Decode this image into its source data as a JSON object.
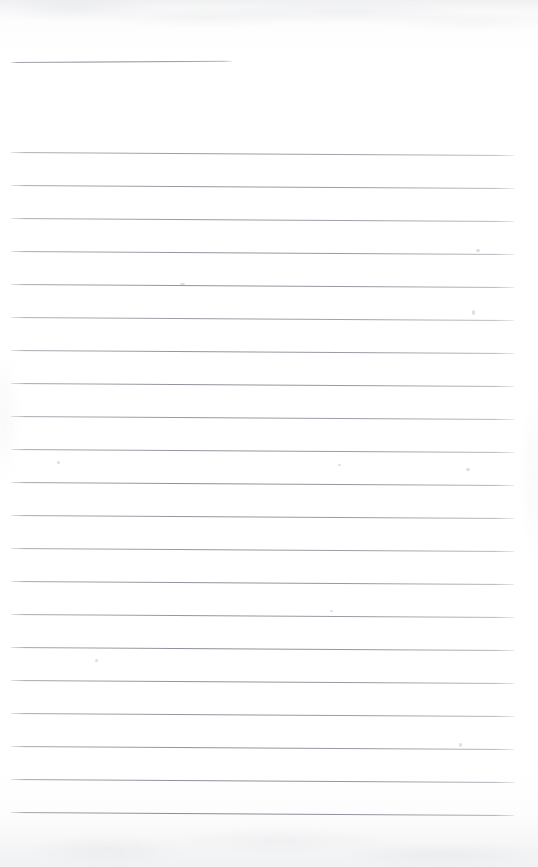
{
  "document": {
    "kind": "scanned-blank-ruled-page",
    "title": "Blank Ruled Notebook Page",
    "page_width": 538,
    "page_height": 867,
    "has_text": false,
    "has_handwriting": false,
    "visible_text": "",
    "paper_color": "#fefefe",
    "rule_color": "#7c7e88",
    "edge_shadow_color": "#eff0f1",
    "orientation": "portrait"
  },
  "rules": {
    "count": 22,
    "left_margin_px": 11,
    "right_end_px": 514,
    "line_spacing_px": 33,
    "line_thickness_px": 1,
    "first_line_y_px": 62,
    "last_line_y_px": 812,
    "lines": [
      {
        "index": 1,
        "y": 62,
        "x1": 11,
        "x2": 232,
        "partial": true,
        "skew_deg": -0.32,
        "opacity": 0.92
      },
      {
        "index": 2,
        "y": 152,
        "x1": 11,
        "x2": 514,
        "partial": false,
        "skew_deg": 0.34,
        "opacity": 0.8
      },
      {
        "index": 3,
        "y": 185,
        "x1": 11,
        "x2": 514,
        "partial": false,
        "skew_deg": 0.34,
        "opacity": 0.84
      },
      {
        "index": 4,
        "y": 218,
        "x1": 11,
        "x2": 514,
        "partial": false,
        "skew_deg": 0.34,
        "opacity": 0.82
      },
      {
        "index": 5,
        "y": 251,
        "x1": 11,
        "x2": 514,
        "partial": false,
        "skew_deg": 0.34,
        "opacity": 0.86
      },
      {
        "index": 6,
        "y": 284,
        "x1": 11,
        "x2": 514,
        "partial": false,
        "skew_deg": 0.34,
        "opacity": 0.88
      },
      {
        "index": 7,
        "y": 317,
        "x1": 11,
        "x2": 514,
        "partial": false,
        "skew_deg": 0.34,
        "opacity": 0.8
      },
      {
        "index": 8,
        "y": 350,
        "x1": 11,
        "x2": 514,
        "partial": false,
        "skew_deg": 0.34,
        "opacity": 0.86
      },
      {
        "index": 9,
        "y": 383,
        "x1": 11,
        "x2": 514,
        "partial": false,
        "skew_deg": 0.34,
        "opacity": 0.88
      },
      {
        "index": 10,
        "y": 416,
        "x1": 11,
        "x2": 514,
        "partial": false,
        "skew_deg": 0.34,
        "opacity": 0.84
      },
      {
        "index": 11,
        "y": 449,
        "x1": 11,
        "x2": 514,
        "partial": false,
        "skew_deg": 0.34,
        "opacity": 0.86
      },
      {
        "index": 12,
        "y": 482,
        "x1": 11,
        "x2": 514,
        "partial": false,
        "skew_deg": 0.34,
        "opacity": 0.9
      },
      {
        "index": 13,
        "y": 515,
        "x1": 11,
        "x2": 514,
        "partial": false,
        "skew_deg": 0.34,
        "opacity": 0.86
      },
      {
        "index": 14,
        "y": 548,
        "x1": 11,
        "x2": 514,
        "partial": false,
        "skew_deg": 0.34,
        "opacity": 0.84
      },
      {
        "index": 15,
        "y": 581,
        "x1": 11,
        "x2": 514,
        "partial": false,
        "skew_deg": 0.34,
        "opacity": 0.88
      },
      {
        "index": 16,
        "y": 614,
        "x1": 11,
        "x2": 514,
        "partial": false,
        "skew_deg": 0.34,
        "opacity": 0.86
      },
      {
        "index": 17,
        "y": 647,
        "x1": 11,
        "x2": 514,
        "partial": false,
        "skew_deg": 0.34,
        "opacity": 0.9
      },
      {
        "index": 18,
        "y": 680,
        "x1": 11,
        "x2": 514,
        "partial": false,
        "skew_deg": 0.34,
        "opacity": 0.88
      },
      {
        "index": 19,
        "y": 713,
        "x1": 11,
        "x2": 514,
        "partial": false,
        "skew_deg": 0.34,
        "opacity": 0.86
      },
      {
        "index": 20,
        "y": 746,
        "x1": 11,
        "x2": 514,
        "partial": false,
        "skew_deg": 0.34,
        "opacity": 0.88
      },
      {
        "index": 21,
        "y": 779,
        "x1": 11,
        "x2": 514,
        "partial": false,
        "skew_deg": 0.34,
        "opacity": 0.9
      },
      {
        "index": 22,
        "y": 812,
        "x1": 11,
        "x2": 514,
        "partial": false,
        "skew_deg": 0.34,
        "opacity": 0.94
      }
    ]
  },
  "specks": [
    {
      "x": 472,
      "y": 310,
      "w": 3,
      "h": 5
    },
    {
      "x": 476,
      "y": 249,
      "w": 4,
      "h": 3
    },
    {
      "x": 180,
      "y": 283,
      "w": 5,
      "h": 2
    },
    {
      "x": 57,
      "y": 461,
      "w": 3,
      "h": 3
    },
    {
      "x": 338,
      "y": 464,
      "w": 3,
      "h": 2
    },
    {
      "x": 466,
      "y": 468,
      "w": 4,
      "h": 3
    },
    {
      "x": 95,
      "y": 659,
      "w": 3,
      "h": 3
    },
    {
      "x": 459,
      "y": 743,
      "w": 3,
      "h": 4
    },
    {
      "x": 330,
      "y": 610,
      "w": 3,
      "h": 2
    }
  ]
}
